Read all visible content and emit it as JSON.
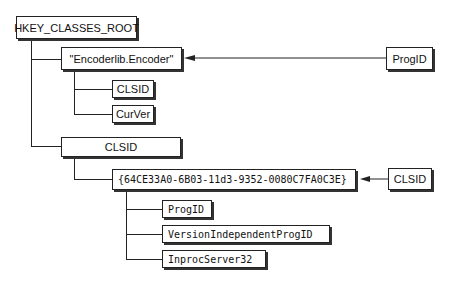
{
  "diagram": {
    "root": {
      "label": "HKEY_CLASSES_ROOT"
    },
    "progid_key": {
      "label": "\"Encoderlib.Encoder\"",
      "children": [
        {
          "label": "CLSID"
        },
        {
          "label": "CurVer"
        }
      ]
    },
    "clsid_key": {
      "label": "CLSID",
      "guid": {
        "label": "{64CE33A0-6B03-11d3-9352-0080C7FA0C3E}",
        "children": [
          {
            "label": "ProgID"
          },
          {
            "label": "VersionIndependentProgID"
          },
          {
            "label": "InprocServer32"
          }
        ]
      }
    },
    "callouts": {
      "progid": {
        "label": "ProgID"
      },
      "clsid": {
        "label": "CLSID"
      }
    }
  }
}
